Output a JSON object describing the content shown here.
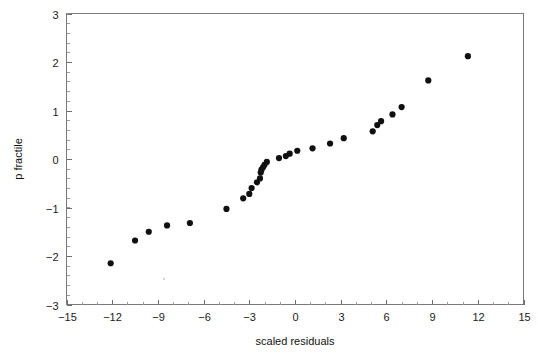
{
  "chart_data": {
    "type": "scatter",
    "title": "",
    "xlabel": "scaled  residuals",
    "ylabel": "p fractile",
    "xlim": [
      -15,
      15
    ],
    "ylim": [
      -3,
      3
    ],
    "xticks": [
      -15,
      -12,
      -9,
      -6,
      -3,
      0,
      3,
      6,
      9,
      12,
      15
    ],
    "xticklabels": [
      "−15",
      "−12",
      "−9",
      "−6",
      "−3",
      "0",
      "3",
      "6",
      "9",
      "12",
      "15"
    ],
    "yticks": [
      -3,
      -2,
      -1,
      0,
      1,
      2,
      3
    ],
    "yticklabels": [
      "−3",
      "−2",
      "−1",
      "0",
      "1",
      "2",
      "3"
    ],
    "x_minor_step": 1,
    "y_minor_step": 0.2,
    "grid": false,
    "legend": null,
    "marker": "filled-circle",
    "marker_color": "#101010",
    "marker_size": 3.1,
    "series": [
      {
        "name": "sample quantiles",
        "points": [
          [
            -12.1,
            -2.15
          ],
          [
            -10.5,
            -1.68
          ],
          [
            -9.6,
            -1.5
          ],
          [
            -8.4,
            -1.37
          ],
          [
            -6.9,
            -1.32
          ],
          [
            -4.5,
            -1.03
          ],
          [
            -3.4,
            -0.81
          ],
          [
            -3.0,
            -0.72
          ],
          [
            -2.85,
            -0.6
          ],
          [
            -2.5,
            -0.48
          ],
          [
            -2.3,
            -0.4
          ],
          [
            -2.25,
            -0.28
          ],
          [
            -2.2,
            -0.22
          ],
          [
            -2.1,
            -0.17
          ],
          [
            -2.0,
            -0.12
          ],
          [
            -1.85,
            -0.06
          ],
          [
            -1.05,
            0.02
          ],
          [
            -0.6,
            0.06
          ],
          [
            -0.35,
            0.11
          ],
          [
            0.15,
            0.17
          ],
          [
            1.15,
            0.22
          ],
          [
            2.3,
            0.32
          ],
          [
            3.2,
            0.43
          ],
          [
            5.1,
            0.57
          ],
          [
            5.4,
            0.7
          ],
          [
            5.65,
            0.78
          ],
          [
            6.4,
            0.92
          ],
          [
            7.0,
            1.07
          ],
          [
            8.75,
            1.62
          ],
          [
            11.35,
            2.12
          ]
        ]
      }
    ],
    "n_points": 30,
    "annotations": [
      {
        "name": "stray-speck",
        "x": -8.6,
        "y": -2.47
      }
    ]
  },
  "axes": {
    "frame_color": "#7a7a7a",
    "background": "#ffffff"
  }
}
